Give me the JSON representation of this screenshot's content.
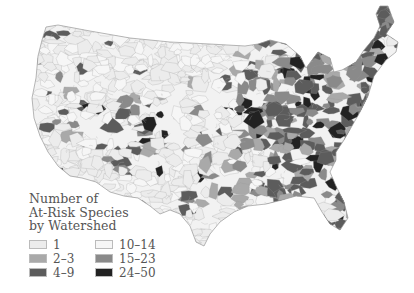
{
  "map": {
    "title": "Number of At-Risk Species by Watershed",
    "region": "Contiguous United States",
    "unit": "watershed"
  },
  "legend": {
    "title_lines": [
      "Number of",
      "At-Risk Species",
      "by Watershed"
    ],
    "classes": [
      {
        "label": "1",
        "color": "#ececec"
      },
      {
        "label": "10–14",
        "color": "#f6f6f6"
      },
      {
        "label": "2–3",
        "color": "#a9a9a9"
      },
      {
        "label": "15–23",
        "color": "#8a8a8a"
      },
      {
        "label": "4–9",
        "color": "#5c5c5c"
      },
      {
        "label": "24–50",
        "color": "#222222"
      }
    ]
  },
  "colors": {
    "background": "#ffffff",
    "boundary": "#8c8c8c",
    "text": "#555555"
  }
}
